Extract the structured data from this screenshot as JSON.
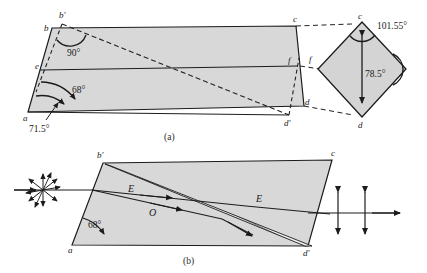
{
  "figure": {
    "title_caption_a": "(a)",
    "title_caption_b": "(b)",
    "colors": {
      "stroke": "#1c1c1c",
      "glass_fill": "#d8d8d8",
      "diamond_fill": "#d4d4d4",
      "dashed": "#2a2a2a",
      "background": "#ffffff"
    }
  },
  "panel_a": {
    "caption": "(a)",
    "vertices": [
      {
        "name": "vertex-a",
        "label": "a",
        "x": 28,
        "y": 112
      },
      {
        "name": "vertex-b",
        "label": "b",
        "x": 52,
        "y": 28
      },
      {
        "name": "vertex-b-prime",
        "label": "b′",
        "x": 64,
        "y": 18
      },
      {
        "name": "vertex-c",
        "label": "c",
        "x": 296,
        "y": 26
      },
      {
        "name": "vertex-d",
        "label": "d",
        "x": 304,
        "y": 106
      },
      {
        "name": "vertex-d-prime",
        "label": "d′",
        "x": 288,
        "y": 119
      },
      {
        "name": "vertex-e",
        "label": "e",
        "x": 41,
        "y": 66
      },
      {
        "name": "vertex-f",
        "label": "f",
        "x": 290,
        "y": 62
      }
    ],
    "angles": [
      {
        "name": "angle-90",
        "value": "90°",
        "x": 83,
        "y": 52
      },
      {
        "name": "angle-68",
        "value": "68°",
        "x": 83,
        "y": 90
      },
      {
        "name": "angle-71-5",
        "value": "71.5°",
        "x": 35,
        "y": 127
      }
    ]
  },
  "panel_a_diamond": {
    "name": "end-face-diamond",
    "vertices": [
      {
        "name": "diamond-vertex-c",
        "label": "c",
        "x": 360,
        "y": 21
      },
      {
        "name": "diamond-vertex-f",
        "label": "f",
        "x": 312,
        "y": 62
      },
      {
        "name": "diamond-vertex-d",
        "label": "d",
        "x": 360,
        "y": 123
      }
    ],
    "angles": [
      {
        "name": "angle-101-55",
        "value": "101.55°",
        "x": 378,
        "y": 30
      },
      {
        "name": "angle-78-5",
        "value": "78.5°",
        "x": 368,
        "y": 73
      }
    ]
  },
  "panel_b": {
    "caption": "(b)",
    "vertices": [
      {
        "name": "vertex-a-b",
        "label": "a",
        "x": 72,
        "y": 245
      },
      {
        "name": "vertex-b-prime-b",
        "label": "b′",
        "x": 100,
        "y": 155
      },
      {
        "name": "vertex-c-b",
        "label": "c",
        "x": 332,
        "y": 155
      },
      {
        "name": "vertex-d-prime-b",
        "label": "d′",
        "x": 308,
        "y": 248
      }
    ],
    "angles": [
      {
        "name": "angle-68-b",
        "value": "68°",
        "x": 95,
        "y": 224
      }
    ],
    "ray_labels": [
      {
        "name": "ray-label-e-left",
        "label": "E",
        "x": 131,
        "y": 196
      },
      {
        "name": "ray-label-o",
        "label": "O",
        "x": 152,
        "y": 213
      },
      {
        "name": "ray-label-e-right",
        "label": "E",
        "x": 259,
        "y": 200
      }
    ],
    "input_symbol": {
      "name": "unpolarized-light-starburst",
      "x": 43,
      "y": 190
    },
    "output_symbols": [
      {
        "name": "polarization-arrow-1",
        "x": 338,
        "y": 213
      },
      {
        "name": "polarization-arrow-2",
        "x": 365,
        "y": 213
      }
    ]
  }
}
